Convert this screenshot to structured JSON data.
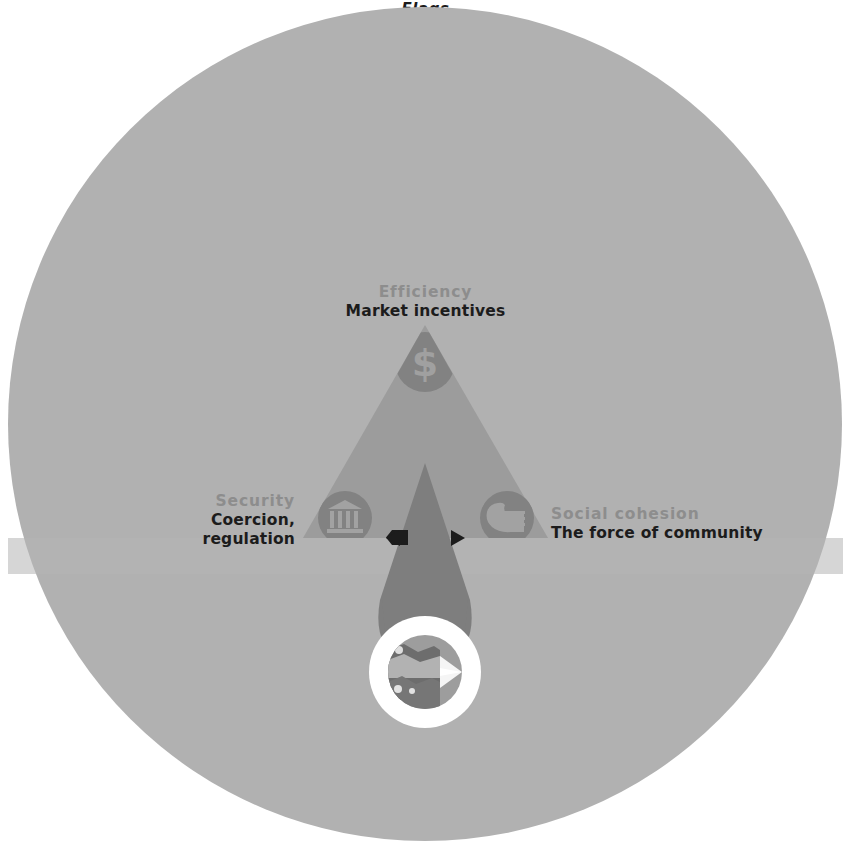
{
  "figure": {
    "background_color": "#ffffff",
    "disc_color": "#b1b1b1",
    "triangle_color": "#9a9a9a",
    "beam_color": "#7d7d7d",
    "icon_disc_color": "#7f7f7f",
    "icon_glyph_color": "#9e9e9e",
    "lens_ring_color": "#ffffff",
    "lens_photo_dark": "#6f6f6f",
    "lens_photo_light": "#d8d8d8",
    "label_muted_color": "#8d8d8d",
    "label_dark_color": "#1c1c1c",
    "arrow_color": "#1c1c1c"
  },
  "vertices": {
    "top": {
      "category": "Efficiency",
      "description": "Market incentives",
      "icon": "dollar-sign-icon"
    },
    "left": {
      "category": "Security",
      "description": "Coercion,\nregulation",
      "description_line_1": "Coercion,",
      "description_line_2": "regulation",
      "icon": "bank-building-icon"
    },
    "right": {
      "category": "Social cohesion",
      "description": "The force of community",
      "icon": "handshake-icon"
    }
  },
  "lens": {
    "caption": "Flags",
    "icon": "magnifier-lens-icon"
  }
}
